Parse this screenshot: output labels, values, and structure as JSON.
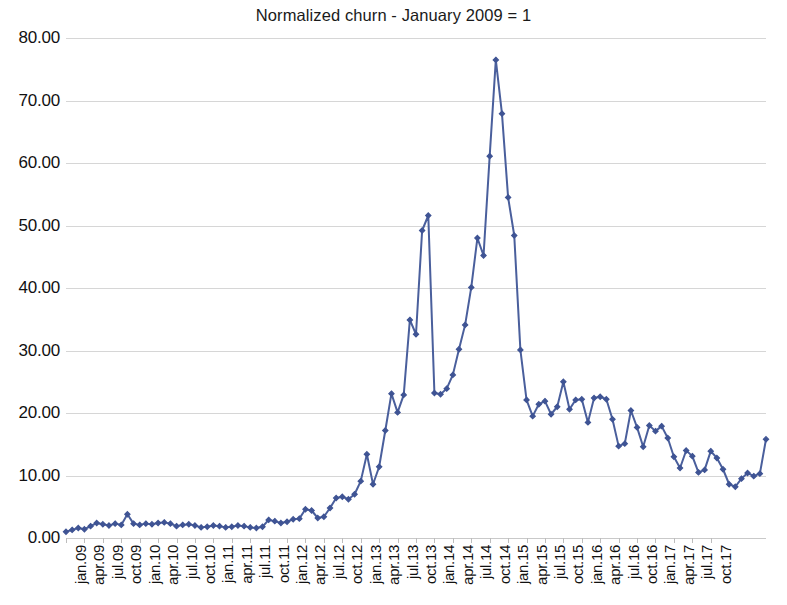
{
  "chart_data": {
    "type": "line",
    "title": "Normalized churn - January 2009 = 1",
    "subtitle": "",
    "xlabel": "",
    "ylabel": "",
    "ylim": [
      0,
      80
    ],
    "ytick_step": 10,
    "ytick_labels": [
      "0.00",
      "10.00",
      "20.00",
      "30.00",
      "40.00",
      "50.00",
      "60.00",
      "70.00",
      "80.00"
    ],
    "ytick_values": [
      0,
      10,
      20,
      30,
      40,
      50,
      60,
      70,
      80
    ],
    "grid": true,
    "grid_axis": "y",
    "legend": false,
    "legend_position": "none",
    "markers": true,
    "marker_shape": "diamond",
    "line_color": "#4a5f9c",
    "marker_color": "#3f5494",
    "grid_color": "#d6d6d6",
    "background_color": "#ffffff",
    "xtick_labels": [
      "jan.09",
      "apr.09",
      "jul.09",
      "oct.09",
      "jan.10",
      "apr.10",
      "jul.10",
      "oct.10",
      "jan.11",
      "apr.11",
      "jul.11",
      "oct.11",
      "jan.12",
      "apr.12",
      "jul.12",
      "oct.12",
      "jan.13",
      "apr.13",
      "jul.13",
      "oct.13",
      "jan.14",
      "apr.14",
      "jul.14",
      "oct.14",
      "jan.15",
      "apr.15",
      "jul.15",
      "oct.15",
      "jan.16",
      "apr.16",
      "jul.16",
      "oct.16",
      "jan.17",
      "apr.17",
      "jul.17",
      "oct.17"
    ],
    "x_first": "jan.09",
    "x_last": "dec.17",
    "x_frequency": "monthly",
    "xtick_frequency": "quarterly",
    "series": [
      {
        "name": "Normalized churn",
        "values": [
          1.0,
          1.3,
          1.6,
          1.4,
          1.9,
          2.4,
          2.2,
          2.0,
          2.3,
          2.1,
          3.8,
          2.3,
          2.1,
          2.3,
          2.2,
          2.4,
          2.5,
          2.3,
          1.9,
          2.1,
          2.2,
          2.0,
          1.7,
          1.8,
          2.0,
          1.9,
          1.7,
          1.8,
          2.0,
          1.9,
          1.7,
          1.6,
          1.8,
          2.9,
          2.7,
          2.4,
          2.6,
          3.0,
          3.1,
          4.6,
          4.4,
          3.2,
          3.4,
          4.8,
          6.4,
          6.6,
          6.2,
          7.0,
          9.1,
          13.4,
          8.6,
          11.4,
          17.2,
          23.1,
          20.1,
          22.9,
          34.9,
          32.6,
          49.2,
          51.6,
          23.2,
          23.0,
          23.9,
          26.1,
          30.2,
          34.1,
          40.1,
          48.0,
          45.2,
          61.1,
          76.5,
          67.9,
          54.5,
          48.4,
          30.1,
          22.1,
          19.5,
          21.4,
          21.9,
          19.8,
          21.0,
          25.0,
          20.6,
          22.1,
          22.2,
          18.5,
          22.4,
          22.6,
          22.2,
          19.0,
          14.7,
          15.1,
          20.4,
          17.7,
          14.6,
          18.0,
          17.1,
          17.9,
          16.0,
          13.0,
          11.2,
          14.0,
          13.1,
          10.5,
          10.9,
          13.9,
          12.8,
          11.0,
          8.6,
          8.2,
          9.5,
          10.4,
          9.9,
          10.3,
          15.8
        ]
      }
    ]
  }
}
